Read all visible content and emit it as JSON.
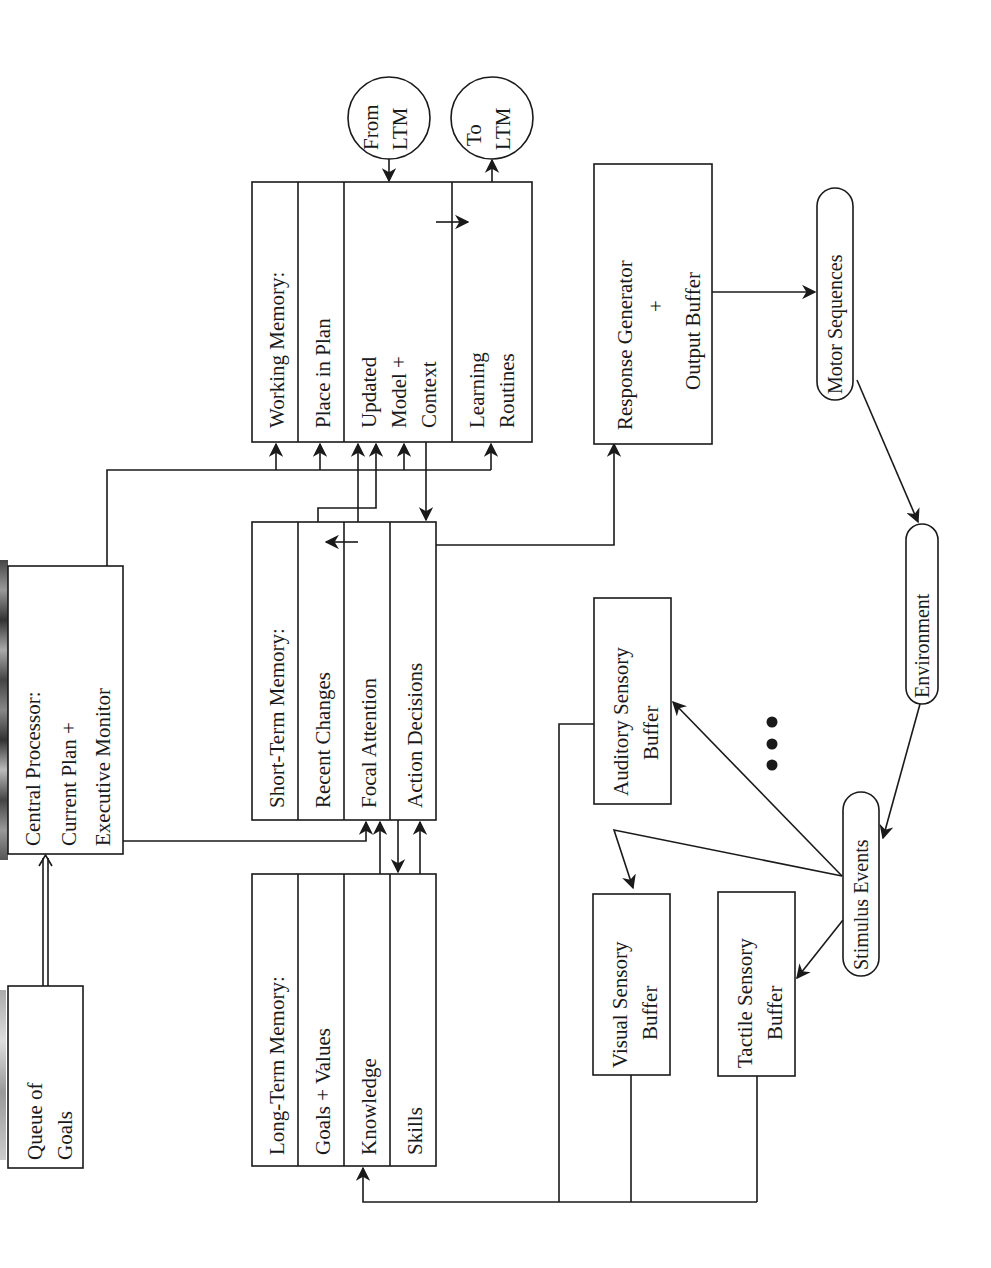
{
  "diagram": {
    "orientation": "rotated-90-ccw",
    "colors": {
      "line": "#1a1a1a",
      "background": "#ffffff",
      "scan_edge": "#555555"
    },
    "nodes": {
      "queue_of_goals": {
        "lines": [
          "Queue of",
          "Goals"
        ]
      },
      "central_processor": {
        "lines": [
          "Central Processor:",
          "Current Plan +",
          "Executive Monitor"
        ]
      },
      "long_term_memory": {
        "title": "Long-Term Memory:",
        "rows": [
          "Goals + Values",
          "Knowledge",
          "Skills"
        ]
      },
      "short_term_memory": {
        "title": "Short-Term Memory:",
        "rows": [
          "Recent Changes",
          "Focal Attention",
          "Action Decisions"
        ]
      },
      "working_memory": {
        "title": "Working Memory:",
        "rows": [
          "Place in Plan",
          "Updated",
          "Model +",
          "Context",
          "Learning",
          "Routines"
        ]
      },
      "from_ltm": {
        "lines": [
          "From",
          "LTM"
        ]
      },
      "to_ltm": {
        "lines": [
          "To",
          "LTM"
        ]
      },
      "response_generator": {
        "lines": [
          "Response Generator",
          "+",
          "Output Buffer"
        ]
      },
      "motor_sequences": {
        "label": "Motor Sequences"
      },
      "environment": {
        "label": "Environment"
      },
      "stimulus_events": {
        "label": "Stimulus Events"
      },
      "auditory_buffer": {
        "lines": [
          "Auditory Sensory",
          "Buffer"
        ]
      },
      "visual_buffer": {
        "lines": [
          "Visual Sensory",
          "Buffer"
        ]
      },
      "tactile_buffer": {
        "lines": [
          "Tactile Sensory",
          "Buffer"
        ]
      },
      "ellipsis": {
        "label": "• • •"
      }
    },
    "edges": [
      {
        "from": "Queue of Goals",
        "to": "Central Processor",
        "style": "double"
      },
      {
        "from": "Central Processor",
        "to": "Working Memory (all rows)"
      },
      {
        "from": "Central Processor",
        "to": "Short-Term Memory: Focal Attention"
      },
      {
        "from": "Short-Term Memory: Recent Changes",
        "to": "Working Memory: Updated Model + Context"
      },
      {
        "from": "Long-Term Memory: Skills",
        "to": "Short-Term Memory: Focal Attention"
      },
      {
        "from": "Short-Term Memory: Action Decisions",
        "to": "Long-Term Memory: Skills"
      },
      {
        "from": "Long-Term Memory: Skills",
        "to": "Short-Term Memory: Action Decisions"
      },
      {
        "from": "Working Memory: Updated Model + Context",
        "to": "Short-Term Memory: Action Decisions"
      },
      {
        "from": "From LTM",
        "to": "Working Memory: Updated Model + Context"
      },
      {
        "from": "Working Memory: Learning Routines",
        "to": "To LTM"
      },
      {
        "from": "Short-Term Memory: Action Decisions",
        "to": "Response Generator"
      },
      {
        "from": "Response Generator",
        "to": "Motor Sequences"
      },
      {
        "from": "Motor Sequences",
        "to": "Environment"
      },
      {
        "from": "Environment",
        "to": "Stimulus Events"
      },
      {
        "from": "Stimulus Events",
        "to": "Auditory Sensory Buffer"
      },
      {
        "from": "Stimulus Events",
        "to": "Visual Sensory Buffer"
      },
      {
        "from": "Stimulus Events",
        "to": "Tactile Sensory Buffer"
      },
      {
        "from": "Sensory Buffers",
        "to": "Long-Term Memory: Knowledge"
      }
    ]
  }
}
